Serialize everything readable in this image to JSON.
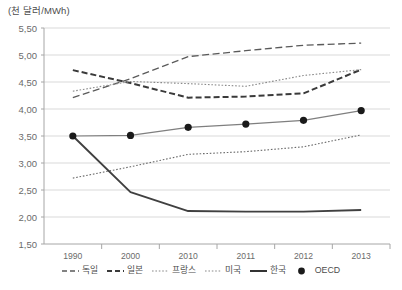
{
  "chart_data": {
    "type": "line",
    "title": "(천 달러/MWh)",
    "xlabel": "",
    "ylabel": "(천 달러/MWh)",
    "x": [
      "1990",
      "2000",
      "2010",
      "2011",
      "2012",
      "2013"
    ],
    "categories": [
      "1990",
      "2000",
      "2010",
      "2011",
      "2012",
      "2013"
    ],
    "ylim": [
      1.5,
      5.5
    ],
    "yticks": [
      1.5,
      2.0,
      2.5,
      3.0,
      3.5,
      4.0,
      4.5,
      5.0,
      5.5
    ],
    "ytick_labels": [
      "1,50",
      "2,00",
      "2,50",
      "3,00",
      "3,50",
      "4,00",
      "4,50",
      "5,00",
      "5,50"
    ],
    "grid": true,
    "legend_position": "bottom",
    "decimal_separator": ",",
    "series": [
      {
        "name": "독일",
        "style": "dashed",
        "color": "#5a5a5a",
        "values": [
          4.21,
          4.56,
          4.97,
          5.08,
          5.18,
          5.22
        ]
      },
      {
        "name": "일본",
        "style": "dashed-bold",
        "color": "#3a3a3a",
        "values": [
          4.72,
          4.48,
          4.21,
          4.23,
          4.29,
          4.73
        ]
      },
      {
        "name": "프랑스",
        "style": "dotted",
        "color": "#8a8a8a",
        "values": [
          4.33,
          4.51,
          4.47,
          4.42,
          4.62,
          4.73
        ]
      },
      {
        "name": "미국",
        "style": "dotted",
        "color": "#6b6b6b",
        "values": [
          2.72,
          2.93,
          3.16,
          3.21,
          3.3,
          3.52
        ]
      },
      {
        "name": "한국",
        "style": "solid-bold",
        "color": "#404040",
        "values": [
          3.5,
          2.46,
          2.11,
          2.1,
          2.1,
          2.13
        ]
      },
      {
        "name": "OECD",
        "style": "solid-marker",
        "color": "#7f7f7f",
        "marker": "circle",
        "values": [
          3.5,
          3.51,
          3.66,
          3.72,
          3.79,
          3.97
        ]
      }
    ]
  },
  "legend": {
    "items": [
      {
        "label": "독일",
        "swatch": "dashed"
      },
      {
        "label": "일본",
        "swatch": "dashed-bold"
      },
      {
        "label": "프랑스",
        "swatch": "dotted"
      },
      {
        "label": "미국",
        "swatch": "dotted"
      },
      {
        "label": "한국",
        "swatch": "solid-bold"
      },
      {
        "label": "OECD",
        "swatch": "marker"
      }
    ]
  },
  "colors": {
    "background": "#ffffff",
    "grid": "#d9d9d9",
    "axis": "#a6a6a6",
    "text": "#595959"
  }
}
